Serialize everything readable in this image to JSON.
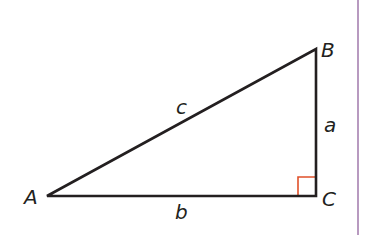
{
  "diagram": {
    "type": "right-triangle",
    "vertices": {
      "A": {
        "label": "A",
        "x": 47,
        "y": 196
      },
      "B": {
        "label": "B",
        "x": 316,
        "y": 49
      },
      "C": {
        "label": "C",
        "x": 316,
        "y": 196
      }
    },
    "sides": {
      "hypotenuse": {
        "label": "c",
        "from": "A",
        "to": "B"
      },
      "vertical": {
        "label": "a",
        "from": "B",
        "to": "C"
      },
      "base": {
        "label": "b",
        "from": "A",
        "to": "C"
      }
    },
    "right_angle_at": "C",
    "colors": {
      "stroke": "#231f20",
      "right_angle_marker": "#e0502a",
      "margin_rule": "#b89ac0",
      "background": "#ffffff"
    }
  }
}
